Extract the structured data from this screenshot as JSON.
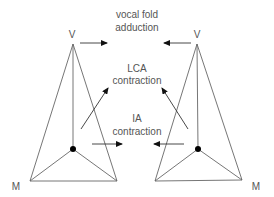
{
  "figure": {
    "labels": {
      "vocal_fold_line1": "vocal fold",
      "vocal_fold_line2": "adduction",
      "lca_line1": "LCA",
      "lca_line2": "contraction",
      "ia_line1": "IA",
      "ia_line2": "contraction"
    },
    "left_model": {
      "apex_label": "V",
      "corner_label": "M"
    },
    "right_model": {
      "apex_label": "V",
      "corner_label": "M"
    },
    "colors": {
      "lines": "#666666",
      "arrows": "#333333",
      "joint_dot": "#000000",
      "text": "#555555"
    }
  }
}
